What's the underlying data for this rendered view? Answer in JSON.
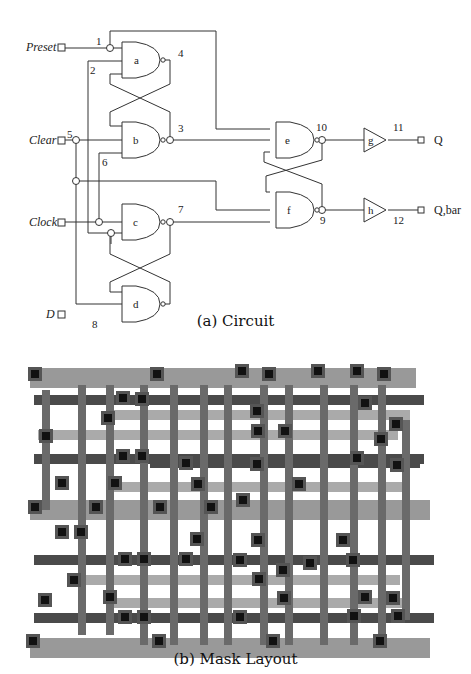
{
  "figure": {
    "captions": {
      "circuit": "(a) Circuit",
      "layout": "(b) Mask Layout"
    }
  },
  "circuit": {
    "inputs": [
      {
        "label": "Preset",
        "node": "1"
      },
      {
        "label": "Clear",
        "node": "5"
      },
      {
        "label": "Clock",
        "node": ""
      },
      {
        "label": "D",
        "node": "8"
      }
    ],
    "outputs": [
      {
        "label": "Q",
        "node": "11"
      },
      {
        "label": "Q,bar",
        "node": "12"
      }
    ],
    "gates": {
      "a": "a",
      "b": "b",
      "c": "c",
      "d": "d",
      "e": "e",
      "f": "f",
      "g": "g",
      "h": "h"
    },
    "node_labels": {
      "n1": "1",
      "n2": "2",
      "n3": "3",
      "n4": "4",
      "n5": "5",
      "n6": "6",
      "n7": "7",
      "n8": "8",
      "n9": "9",
      "n10": "10",
      "n11": "11",
      "n12": "12"
    }
  },
  "layout": {
    "colors": {
      "metal": "#8a8a8a",
      "poly": "#5a5a5a",
      "diff": "#a0a0a0",
      "contact": "#111111",
      "contact_ring": "#444444"
    }
  }
}
